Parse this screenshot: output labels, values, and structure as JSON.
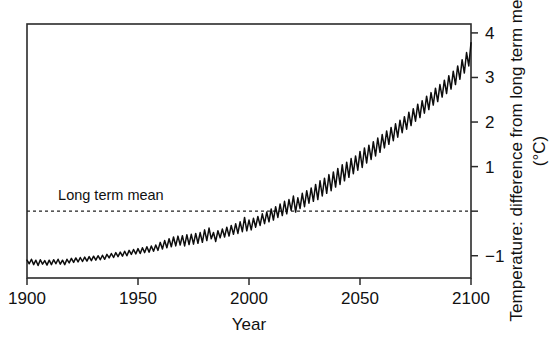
{
  "figure": {
    "background": "#ffffff",
    "ink_color": "#111111"
  },
  "chart_data": {
    "type": "line",
    "title": "",
    "xlabel": "Year",
    "ylabel": "Temperature: difference from long term mean",
    "ylabel_units": "(°C)",
    "xlim": [
      1900,
      2100
    ],
    "ylim": [
      -1.5,
      4.2
    ],
    "xticks": [
      1900,
      1950,
      2000,
      2050,
      2100
    ],
    "xtick_labels": [
      "1900",
      "1950",
      "2000",
      "2050",
      "2100"
    ],
    "yticks": [
      -1,
      0,
      1,
      2,
      3,
      4
    ],
    "ytick_labels": [
      "-1",
      "",
      "1",
      "2",
      "3",
      "4"
    ],
    "grid": false,
    "legend": null,
    "annotations": [
      {
        "name": "long-term-mean-label",
        "text": "Long term mean",
        "x": 1914,
        "y": 0.25
      }
    ],
    "reference_lines": [
      {
        "name": "long-term-mean-line",
        "orientation": "horizontal",
        "value": 0,
        "style": "dashed",
        "color": "#222222"
      }
    ],
    "series": [
      {
        "name": "Global temperature anomaly projection",
        "color": "#0d0d0d",
        "x": [
          1900,
          1901,
          1902,
          1903,
          1904,
          1905,
          1906,
          1907,
          1908,
          1909,
          1910,
          1911,
          1912,
          1913,
          1914,
          1915,
          1916,
          1917,
          1918,
          1919,
          1920,
          1921,
          1922,
          1923,
          1924,
          1925,
          1926,
          1927,
          1928,
          1929,
          1930,
          1931,
          1932,
          1933,
          1934,
          1935,
          1936,
          1937,
          1938,
          1939,
          1940,
          1941,
          1942,
          1943,
          1944,
          1945,
          1946,
          1947,
          1948,
          1949,
          1950,
          1951,
          1952,
          1953,
          1954,
          1955,
          1956,
          1957,
          1958,
          1959,
          1960,
          1961,
          1962,
          1963,
          1964,
          1965,
          1966,
          1967,
          1968,
          1969,
          1970,
          1971,
          1972,
          1973,
          1974,
          1975,
          1976,
          1977,
          1978,
          1979,
          1980,
          1981,
          1982,
          1983,
          1984,
          1985,
          1986,
          1987,
          1988,
          1989,
          1990,
          1991,
          1992,
          1993,
          1994,
          1995,
          1996,
          1997,
          1998,
          1999,
          2000,
          2001,
          2002,
          2003,
          2004,
          2005,
          2006,
          2007,
          2008,
          2009,
          2010,
          2011,
          2012,
          2013,
          2014,
          2015,
          2016,
          2017,
          2018,
          2019,
          2020,
          2021,
          2022,
          2023,
          2024,
          2025,
          2026,
          2027,
          2028,
          2029,
          2030,
          2031,
          2032,
          2033,
          2034,
          2035,
          2036,
          2037,
          2038,
          2039,
          2040,
          2041,
          2042,
          2043,
          2044,
          2045,
          2046,
          2047,
          2048,
          2049,
          2050,
          2051,
          2052,
          2053,
          2054,
          2055,
          2056,
          2057,
          2058,
          2059,
          2060,
          2061,
          2062,
          2063,
          2064,
          2065,
          2066,
          2067,
          2068,
          2069,
          2070,
          2071,
          2072,
          2073,
          2074,
          2075,
          2076,
          2077,
          2078,
          2079,
          2080,
          2081,
          2082,
          2083,
          2084,
          2085,
          2086,
          2087,
          2088,
          2089,
          2090,
          2091,
          2092,
          2093,
          2094,
          2095,
          2096,
          2097,
          2098,
          2099,
          2100
        ],
        "y": [
          -1.1,
          -1.18,
          -1.08,
          -1.2,
          -1.1,
          -1.22,
          -1.09,
          -1.19,
          -1.11,
          -1.21,
          -1.1,
          -1.2,
          -1.09,
          -1.18,
          -1.08,
          -1.19,
          -1.1,
          -1.2,
          -1.08,
          -1.16,
          -1.06,
          -1.15,
          -1.05,
          -1.14,
          -1.04,
          -1.13,
          -1.03,
          -1.12,
          -1.02,
          -1.11,
          -1.01,
          -1.1,
          -1.0,
          -1.09,
          -0.99,
          -1.08,
          -0.97,
          -1.05,
          -0.95,
          -1.04,
          -0.93,
          -1.02,
          -0.92,
          -1.01,
          -0.9,
          -1.0,
          -0.88,
          -0.97,
          -0.86,
          -0.96,
          -0.84,
          -0.95,
          -0.82,
          -0.93,
          -0.8,
          -0.92,
          -0.78,
          -0.9,
          -0.76,
          -0.88,
          -0.7,
          -0.85,
          -0.66,
          -0.82,
          -0.62,
          -0.8,
          -0.58,
          -0.78,
          -0.56,
          -0.76,
          -0.55,
          -0.78,
          -0.53,
          -0.75,
          -0.52,
          -0.74,
          -0.5,
          -0.72,
          -0.48,
          -0.7,
          -0.42,
          -0.66,
          -0.38,
          -0.62,
          -0.48,
          -0.68,
          -0.44,
          -0.6,
          -0.4,
          -0.58,
          -0.36,
          -0.56,
          -0.32,
          -0.52,
          -0.28,
          -0.5,
          -0.24,
          -0.46,
          -0.14,
          -0.44,
          -0.2,
          -0.42,
          -0.16,
          -0.36,
          -0.12,
          -0.32,
          -0.06,
          -0.28,
          -0.02,
          -0.24,
          0.05,
          -0.2,
          0.1,
          -0.14,
          0.16,
          -0.1,
          0.22,
          -0.06,
          0.26,
          0.02,
          0.34,
          -0.02,
          0.3,
          0.06,
          0.4,
          0.1,
          0.46,
          0.18,
          0.52,
          0.22,
          0.6,
          0.26,
          0.68,
          0.34,
          0.74,
          0.4,
          0.82,
          0.46,
          0.88,
          0.54,
          0.96,
          0.6,
          1.04,
          0.68,
          1.1,
          0.76,
          1.18,
          0.84,
          1.24,
          0.92,
          1.34,
          0.98,
          1.42,
          1.08,
          1.48,
          1.16,
          1.56,
          1.24,
          1.64,
          1.32,
          1.72,
          1.42,
          1.8,
          1.5,
          1.88,
          1.58,
          1.96,
          1.66,
          2.04,
          1.76,
          2.12,
          1.84,
          2.22,
          1.92,
          2.3,
          2.02,
          2.4,
          2.1,
          2.48,
          2.2,
          2.58,
          2.28,
          2.66,
          2.38,
          2.76,
          2.46,
          2.84,
          2.56,
          2.94,
          2.64,
          3.04,
          2.74,
          3.14,
          2.84,
          3.26,
          2.96,
          3.4,
          3.1,
          3.56,
          3.26,
          3.78
        ]
      }
    ]
  },
  "axis_geometry": {
    "plot_left": 27,
    "plot_right": 471,
    "plot_top": 24,
    "plot_bottom": 278
  }
}
